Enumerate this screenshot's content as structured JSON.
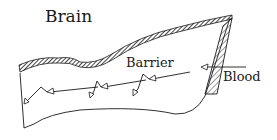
{
  "diagram": {
    "labels": {
      "brain": "Brain",
      "barrier": "Barrier",
      "blood": "Blood"
    },
    "colors": {
      "ink": "#1a1a1a",
      "background": "#ffffff"
    },
    "elements": [
      "tissue-slab",
      "hatched-top-edge",
      "hatched-barrier-wall",
      "blood-arrow",
      "diffusion-arrows"
    ]
  }
}
